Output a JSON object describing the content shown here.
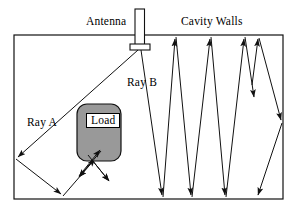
{
  "figure": {
    "background_color": "#ffffff",
    "stroke_color": "#000000",
    "load_fill_color": "#999999",
    "labels": {
      "antenna": "Antenna",
      "cavity_walls": "Cavity Walls",
      "ray_a": "Ray A",
      "ray_b": "Ray B",
      "load": "Load"
    },
    "icons": {
      "antenna": "antenna-icon",
      "load": "load-block-icon",
      "arrow": "arrowhead-icon"
    },
    "geometry": {
      "cavity_rect": {
        "x": 14,
        "y": 35,
        "width": 269,
        "height": 164
      },
      "antenna_mast": {
        "x": 135,
        "y": 9,
        "width": 9,
        "height": 37
      },
      "antenna_base": {
        "x": 130,
        "y": 44,
        "width": 19,
        "height": 6
      },
      "load_block": {
        "x": 77,
        "y": 104,
        "width": 44,
        "height": 57,
        "radius": 10
      },
      "load_label_box": {
        "x": 86,
        "y": 113,
        "width": 28,
        "height": 13
      }
    },
    "ray_a_path": [
      {
        "x": 139,
        "y": 50
      },
      {
        "x": 16,
        "y": 159
      },
      {
        "x": 63,
        "y": 196
      },
      {
        "x": 96,
        "y": 158
      }
    ],
    "ray_a_scatter": [
      {
        "x": 78,
        "y": 178
      },
      {
        "x": 110,
        "y": 182
      }
    ],
    "ray_b_path": [
      {
        "x": 141,
        "y": 50
      },
      {
        "x": 163,
        "y": 197
      },
      {
        "x": 176,
        "y": 37
      },
      {
        "x": 192,
        "y": 197
      },
      {
        "x": 211,
        "y": 37
      },
      {
        "x": 226,
        "y": 197
      },
      {
        "x": 245,
        "y": 37
      },
      {
        "x": 255,
        "y": 99
      },
      {
        "x": 258,
        "y": 37
      },
      {
        "x": 282,
        "y": 122
      },
      {
        "x": 257,
        "y": 197
      }
    ]
  }
}
